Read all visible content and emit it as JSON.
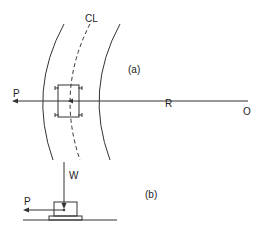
{
  "diagram": {
    "part_a": {
      "label": "(a)",
      "centerline_label": "CL",
      "force_label": "P",
      "radius_label": "R",
      "origin_label": "O"
    },
    "part_b": {
      "label": "(b)",
      "weight_label": "W",
      "force_label": "P"
    },
    "colors": {
      "stroke": "#333333",
      "background": "#ffffff"
    }
  }
}
